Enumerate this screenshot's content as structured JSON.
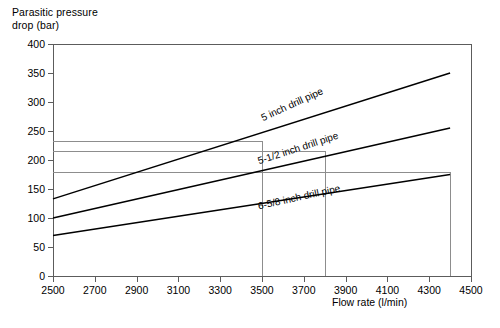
{
  "chart_data": {
    "type": "line",
    "title": "",
    "ylabel": "Parasitic pressure\ndrop (bar)",
    "xlabel": "Flow rate (l/min)",
    "xlim": [
      2500,
      4500
    ],
    "ylim": [
      0,
      400
    ],
    "xticks": [
      2500,
      2700,
      2900,
      3100,
      3300,
      3500,
      3700,
      3900,
      4100,
      4300,
      4500
    ],
    "yticks": [
      0,
      50,
      100,
      150,
      200,
      250,
      300,
      350,
      400
    ],
    "grid": false,
    "legend": "inline-labels-on-curves",
    "x": [
      2500,
      4400
    ],
    "series": [
      {
        "name": "5 inch drill pipe",
        "values": [
          133,
          350
        ],
        "label_x": 3660,
        "label_y": 272,
        "label_angle": -24.5
      },
      {
        "name": "5-1/2 inch drill pipe",
        "values": [
          100,
          255
        ],
        "label_x": 3680,
        "label_y": 198,
        "label_angle": -18.0
      },
      {
        "name": "6-5/8 inch drill pipe",
        "values": [
          70,
          175
        ],
        "label_x": 3680,
        "label_y": 120,
        "label_angle": -12.5
      }
    ],
    "guide_lines": {
      "horizontal": [
        {
          "y": 232,
          "x_end": 3500
        },
        {
          "y": 215,
          "x_end": 3800
        },
        {
          "y": 180,
          "x_end": 4400
        }
      ],
      "vertical": [
        {
          "x": 3500,
          "y_top": 232
        },
        {
          "x": 3800,
          "y_top": 215
        },
        {
          "x": 4400,
          "y_top": 180
        }
      ]
    }
  }
}
